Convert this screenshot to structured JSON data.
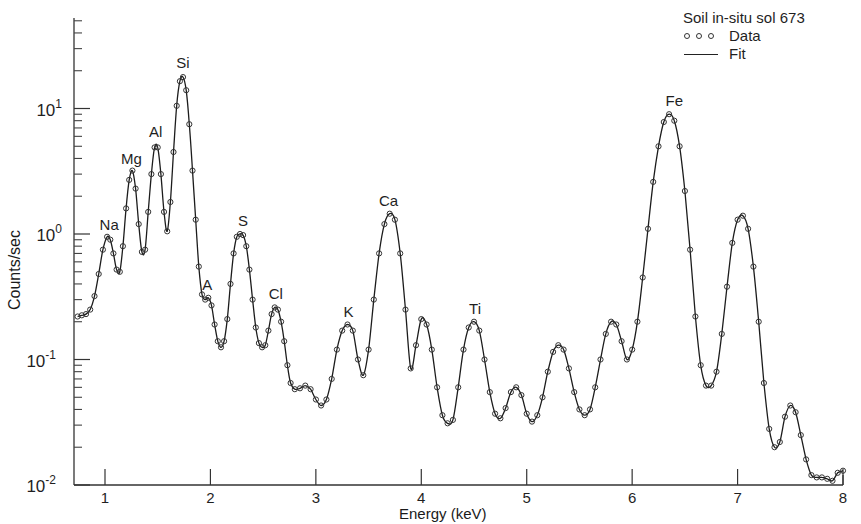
{
  "chart_data": {
    "type": "line",
    "title": "",
    "xlabel": "Energy (keV)",
    "ylabel": "Counts/sec",
    "yscale": "log",
    "xlim": [
      0.68,
      8.0
    ],
    "ylim": [
      0.01,
      50
    ],
    "grid": false,
    "legend": {
      "title": "Soil in-situ sol 673",
      "position": "upper right",
      "entries": [
        {
          "label": "Data",
          "style": "open-circles"
        },
        {
          "label": "Fit",
          "style": "solid-line"
        }
      ]
    },
    "xticks": [
      1,
      2,
      3,
      4,
      5,
      6,
      7,
      8
    ],
    "xtick_labels": [
      "1",
      "2",
      "3",
      "4",
      "5",
      "6",
      "7",
      "8"
    ],
    "yticks": [
      0.01,
      0.1,
      1,
      10
    ],
    "ytick_labels": [
      "10-2",
      "10-1",
      "100",
      "101"
    ],
    "annotations": [
      {
        "text": "Na",
        "x": 1.04,
        "y": 0.93
      },
      {
        "text": "Mg",
        "x": 1.25,
        "y": 3.1
      },
      {
        "text": "Al",
        "x": 1.48,
        "y": 5.1
      },
      {
        "text": "Si",
        "x": 1.74,
        "y": 18
      },
      {
        "text": "A",
        "x": 1.97,
        "y": 0.31
      },
      {
        "text": "S",
        "x": 2.31,
        "y": 1.0
      },
      {
        "text": "Cl",
        "x": 2.62,
        "y": 0.26
      },
      {
        "text": "K",
        "x": 3.31,
        "y": 0.19
      },
      {
        "text": "Ca",
        "x": 3.69,
        "y": 1.45
      },
      {
        "text": "Ti",
        "x": 4.51,
        "y": 0.2
      },
      {
        "text": "Fe",
        "x": 6.4,
        "y": 9.0
      }
    ],
    "series": [
      {
        "name": "Data",
        "style": "open-circles",
        "x": [
          0.74,
          0.78,
          0.82,
          0.86,
          0.9,
          0.94,
          0.98,
          1.02,
          1.05,
          1.08,
          1.11,
          1.14,
          1.17,
          1.2,
          1.23,
          1.26,
          1.29,
          1.32,
          1.35,
          1.38,
          1.41,
          1.44,
          1.47,
          1.5,
          1.53,
          1.56,
          1.59,
          1.62,
          1.65,
          1.68,
          1.71,
          1.74,
          1.77,
          1.8,
          1.83,
          1.86,
          1.89,
          1.92,
          1.95,
          1.98,
          2.01,
          2.04,
          2.07,
          2.1,
          2.13,
          2.16,
          2.19,
          2.22,
          2.25,
          2.28,
          2.31,
          2.34,
          2.37,
          2.4,
          2.43,
          2.46,
          2.49,
          2.52,
          2.55,
          2.58,
          2.61,
          2.64,
          2.67,
          2.7,
          2.73,
          2.76,
          2.8,
          2.85,
          2.9,
          2.95,
          3.0,
          3.05,
          3.1,
          3.15,
          3.2,
          3.25,
          3.3,
          3.35,
          3.4,
          3.45,
          3.5,
          3.55,
          3.6,
          3.65,
          3.7,
          3.75,
          3.8,
          3.85,
          3.9,
          3.95,
          4.0,
          4.05,
          4.1,
          4.15,
          4.2,
          4.25,
          4.3,
          4.35,
          4.4,
          4.45,
          4.5,
          4.55,
          4.6,
          4.65,
          4.7,
          4.75,
          4.8,
          4.85,
          4.9,
          4.95,
          5.0,
          5.05,
          5.1,
          5.15,
          5.2,
          5.25,
          5.3,
          5.35,
          5.4,
          5.45,
          5.5,
          5.55,
          5.6,
          5.65,
          5.7,
          5.75,
          5.8,
          5.85,
          5.9,
          5.95,
          6.0,
          6.05,
          6.1,
          6.15,
          6.2,
          6.25,
          6.3,
          6.35,
          6.4,
          6.45,
          6.5,
          6.55,
          6.6,
          6.65,
          6.7,
          6.75,
          6.8,
          6.85,
          6.9,
          6.95,
          7.0,
          7.05,
          7.1,
          7.15,
          7.2,
          7.25,
          7.3,
          7.35,
          7.4,
          7.45,
          7.5,
          7.55,
          7.6,
          7.65,
          7.7,
          7.75,
          7.8,
          7.85,
          7.9,
          7.95,
          8.0
        ],
        "y": [
          0.22,
          0.225,
          0.23,
          0.25,
          0.32,
          0.48,
          0.75,
          0.95,
          0.9,
          0.7,
          0.52,
          0.5,
          0.8,
          1.6,
          2.7,
          3.2,
          2.3,
          1.2,
          0.72,
          0.75,
          1.5,
          3.0,
          4.9,
          4.9,
          3.0,
          1.5,
          1.05,
          1.8,
          4.5,
          10.5,
          16.5,
          17.8,
          14.0,
          7.5,
          3.2,
          1.3,
          0.55,
          0.33,
          0.3,
          0.31,
          0.27,
          0.19,
          0.14,
          0.125,
          0.14,
          0.21,
          0.4,
          0.7,
          0.95,
          1.0,
          0.98,
          0.8,
          0.52,
          0.3,
          0.18,
          0.135,
          0.125,
          0.13,
          0.17,
          0.23,
          0.26,
          0.25,
          0.2,
          0.14,
          0.09,
          0.065,
          0.058,
          0.059,
          0.062,
          0.058,
          0.048,
          0.043,
          0.048,
          0.07,
          0.12,
          0.17,
          0.19,
          0.17,
          0.1,
          0.075,
          0.12,
          0.3,
          0.7,
          1.2,
          1.45,
          1.3,
          0.7,
          0.25,
          0.085,
          0.13,
          0.21,
          0.19,
          0.12,
          0.06,
          0.036,
          0.031,
          0.033,
          0.06,
          0.12,
          0.18,
          0.2,
          0.17,
          0.1,
          0.055,
          0.037,
          0.034,
          0.041,
          0.055,
          0.06,
          0.052,
          0.037,
          0.032,
          0.036,
          0.05,
          0.08,
          0.115,
          0.13,
          0.12,
          0.085,
          0.055,
          0.04,
          0.036,
          0.04,
          0.06,
          0.1,
          0.16,
          0.2,
          0.19,
          0.14,
          0.1,
          0.12,
          0.2,
          0.45,
          1.1,
          2.6,
          5.0,
          7.8,
          9.0,
          8.0,
          5.0,
          2.2,
          0.75,
          0.22,
          0.09,
          0.062,
          0.062,
          0.08,
          0.16,
          0.38,
          0.85,
          1.3,
          1.4,
          1.1,
          0.55,
          0.2,
          0.065,
          0.028,
          0.02,
          0.022,
          0.035,
          0.043,
          0.038,
          0.025,
          0.016,
          0.012,
          0.0115,
          0.0115,
          0.0112,
          0.0108,
          0.0125,
          0.013
        ]
      },
      {
        "name": "Fit",
        "style": "solid-line",
        "x": "same as Data",
        "y": "same as Data (smooth fit closely tracks data)"
      }
    ]
  }
}
